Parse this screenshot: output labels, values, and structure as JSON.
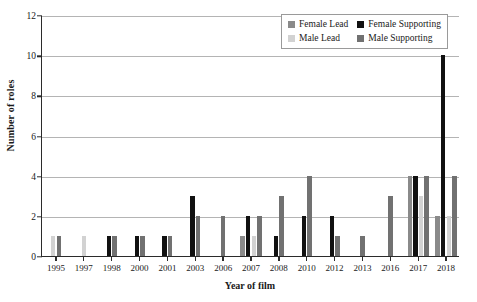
{
  "chart_data": {
    "type": "bar",
    "title": "",
    "xlabel": "Year of film",
    "ylabel": "Number of roles",
    "ylim": [
      0,
      12
    ],
    "yticks": [
      0,
      2,
      4,
      6,
      8,
      10,
      12
    ],
    "grid": true,
    "legend_position": "top-right",
    "categories": [
      "1995",
      "1997",
      "1998",
      "2000",
      "2001",
      "2003",
      "2006",
      "2007",
      "2008",
      "2010",
      "2012",
      "2013",
      "2016",
      "2017",
      "2018"
    ],
    "series": [
      {
        "name": "Female Lead",
        "color": "#8a8a8a",
        "values": [
          0,
          0,
          0,
          0,
          0,
          0,
          0,
          1,
          0,
          0,
          0,
          0,
          0,
          4,
          2
        ]
      },
      {
        "name": "Female Supporting",
        "color": "#111111",
        "values": [
          0,
          0,
          1,
          1,
          1,
          3,
          0,
          2,
          1,
          2,
          2,
          0,
          0,
          4,
          10
        ]
      },
      {
        "name": "Male Lead",
        "color": "#d2d2d2",
        "values": [
          1,
          1,
          0,
          0,
          0,
          0,
          0,
          1,
          0,
          0,
          0,
          0,
          0,
          3,
          2
        ]
      },
      {
        "name": "Male Supporting",
        "color": "#717171",
        "values": [
          1,
          0,
          1,
          1,
          1,
          2,
          2,
          2,
          3,
          4,
          1,
          1,
          3,
          4,
          4
        ]
      }
    ]
  },
  "legend": {
    "items": [
      {
        "label": "Female Lead",
        "color": "#8a8a8a"
      },
      {
        "label": "Female Supporting",
        "color": "#111111"
      },
      {
        "label": "Male Lead",
        "color": "#d2d2d2"
      },
      {
        "label": "Male Supporting",
        "color": "#717171"
      }
    ]
  }
}
